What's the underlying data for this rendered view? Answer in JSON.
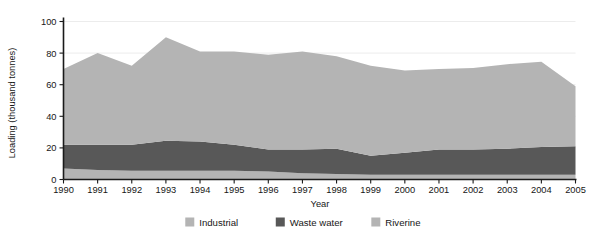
{
  "chart_data": {
    "type": "area",
    "stacked": true,
    "title": "",
    "xlabel": "Year",
    "ylabel": "Loading (thousand tonnes)",
    "categories": [
      1990,
      1991,
      1992,
      1993,
      1994,
      1995,
      1996,
      1997,
      1998,
      1999,
      2000,
      2001,
      2002,
      2003,
      2004,
      2005
    ],
    "x_tick_labels": [
      "1990",
      "1991",
      "1992",
      "1993",
      "1994",
      "1995",
      "1996",
      "1997",
      "1998",
      "1999",
      "2000",
      "2001",
      "2002",
      "2003",
      "2004",
      "2005"
    ],
    "y_tick_labels": [
      "0",
      "20",
      "40",
      "60",
      "80",
      "100"
    ],
    "y_ticks": [
      0,
      20,
      40,
      60,
      80,
      100
    ],
    "ylim": [
      0,
      100
    ],
    "xlim": [
      1990,
      2005
    ],
    "grid": true,
    "legend_position": "bottom",
    "series": [
      {
        "name": "Industrial",
        "color": "#b4b4b4",
        "values": [
          7.0,
          6.0,
          5.5,
          5.5,
          5.5,
          5.5,
          5.0,
          4.0,
          3.5,
          3.0,
          3.0,
          3.0,
          3.0,
          3.0,
          3.0,
          3.0
        ]
      },
      {
        "name": "Waste water",
        "color": "#585858",
        "values": [
          15.0,
          16.0,
          16.5,
          19.0,
          18.5,
          16.5,
          14.0,
          15.0,
          16.0,
          12.0,
          14.0,
          16.0,
          16.0,
          16.5,
          17.5,
          18.0
        ]
      },
      {
        "name": "Riverine",
        "color": "#b4b4b4",
        "values": [
          48.0,
          58.0,
          50.0,
          65.5,
          57.0,
          59.0,
          60.0,
          62.0,
          58.5,
          57.0,
          52.0,
          51.0,
          51.5,
          53.5,
          54.0,
          38.0
        ]
      }
    ],
    "totals": [
      70,
      80,
      72,
      90,
      81,
      81,
      79,
      81,
      78,
      72,
      69,
      70,
      70.5,
      73,
      74.5,
      59
    ]
  },
  "legend": {
    "items": [
      {
        "label": "Industrial",
        "color": "#b4b4b4"
      },
      {
        "label": "Waste water",
        "color": "#585858"
      },
      {
        "label": "Riverine",
        "color": "#b4b4b4"
      }
    ]
  },
  "axes": {
    "y_title": "Loading (thousand tonnes)",
    "x_title": "Year"
  }
}
